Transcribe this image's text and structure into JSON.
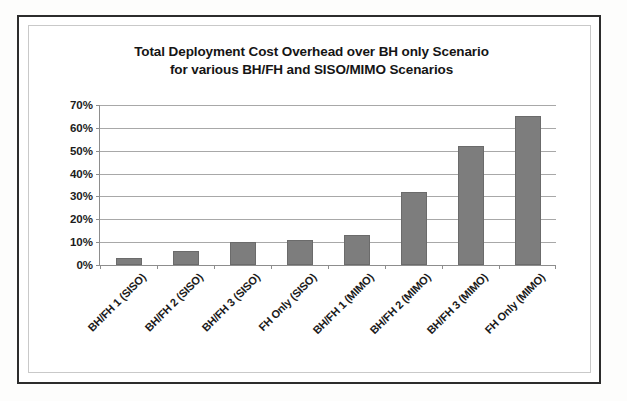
{
  "chart_data": {
    "type": "bar",
    "title": "Total Deployment Cost Overhead over BH only Scenario for various BH/FH and SISO/MIMO Scenarios",
    "title_lines": [
      "Total Deployment Cost Overhead over BH only Scenario",
      "for various BH/FH and SISO/MIMO Scenarios"
    ],
    "categories": [
      "BH/FH 1 (SISO)",
      "BH/FH 2 (SISO)",
      "BH/FH 3 (SISO)",
      "FH Only (SISO)",
      "BH/FH 1 (MIMO)",
      "BH/FH 2 (MIMO)",
      "BH/FH 3 (MIMO)",
      "FH Only (MIMO)"
    ],
    "values": [
      3,
      6,
      10,
      11,
      13,
      32,
      52,
      65
    ],
    "value_unit": "%",
    "xlabel": "",
    "ylabel": "",
    "ylim": [
      0,
      70
    ],
    "ytick_step": 10,
    "ytick_labels": [
      "70%",
      "60%",
      "50%",
      "40%",
      "30%",
      "20%",
      "10%",
      "0%"
    ],
    "ytick_values": [
      70,
      60,
      50,
      40,
      30,
      20,
      10,
      0
    ],
    "grid": true,
    "legend": false,
    "legend_position": "none",
    "series_color": "#7d7d7d",
    "gridline_color": "#a8a8a8",
    "axis_color": "#8d8d8d",
    "text_color": "#1b1b1b",
    "frame_color": "#2c2c2c",
    "background": "#ffffff"
  }
}
